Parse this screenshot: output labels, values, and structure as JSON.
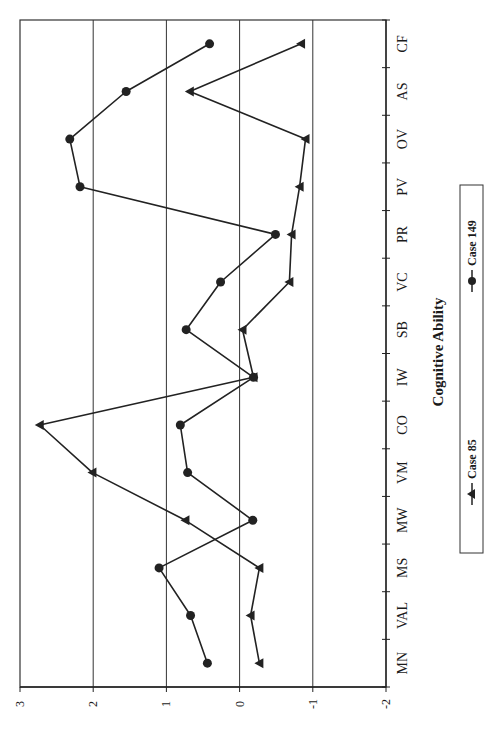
{
  "chart_data": {
    "type": "line",
    "orientation": "rotated-90-clockwise",
    "title": "",
    "xlabel": "Cognitive Ability",
    "ylabel": "",
    "categories": [
      "MN",
      "VAL",
      "MS",
      "MW",
      "VM",
      "CO",
      "IW",
      "SB",
      "VC",
      "PR",
      "PV",
      "OV",
      "AS",
      "CF"
    ],
    "ylim": [
      -2,
      3
    ],
    "yticks": [
      3,
      2,
      1,
      0,
      -1,
      -2
    ],
    "grid": true,
    "legend_position": "right (rotated, below x-axis label)",
    "series": [
      {
        "name": "Case 85",
        "marker": "triangle",
        "values": [
          -0.27,
          -0.15,
          -0.27,
          0.74,
          2.01,
          2.73,
          -0.19,
          -0.04,
          -0.68,
          -0.71,
          -0.82,
          -0.9,
          0.68,
          -0.84
        ]
      },
      {
        "name": "Case 149",
        "marker": "circle",
        "values": [
          0.44,
          0.67,
          1.1,
          -0.18,
          0.71,
          0.81,
          -0.19,
          0.73,
          0.26,
          -0.49,
          2.18,
          2.32,
          1.55,
          0.41
        ]
      }
    ]
  },
  "legend": {
    "items": [
      {
        "label": "Case 85",
        "marker": "triangle"
      },
      {
        "label": "Case 149",
        "marker": "circle"
      }
    ]
  },
  "colors": {
    "line": "#222222",
    "grid": "#333333",
    "background": "#ffffff"
  }
}
